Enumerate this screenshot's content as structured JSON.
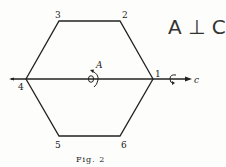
{
  "figure": {
    "caption": "Fig. 2",
    "annotation": "A ⊥ C",
    "vertices": [
      {
        "label": "1",
        "x": 153,
        "y": 79
      },
      {
        "label": "2",
        "x": 120,
        "y": 21
      },
      {
        "label": "3",
        "x": 59,
        "y": 21
      },
      {
        "label": "4",
        "x": 26,
        "y": 79
      },
      {
        "label": "5",
        "x": 59,
        "y": 136
      },
      {
        "label": "6",
        "x": 120,
        "y": 136
      }
    ],
    "axis_a_label": "A",
    "axis_c_label": "c"
  }
}
